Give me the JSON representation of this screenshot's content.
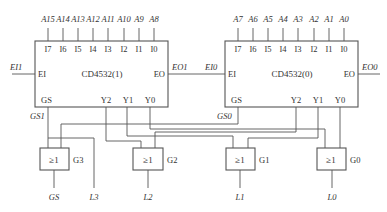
{
  "chips": [
    {
      "name": "CD4532(1)",
      "inputs_top": [
        "I7",
        "I6",
        "I5",
        "I4",
        "I3",
        "I2",
        "I1",
        "I0"
      ],
      "address_labels": [
        "A15",
        "A14",
        "A13",
        "A12",
        "A11",
        "A10",
        "A9",
        "A8"
      ],
      "ei_pin": "EI",
      "eo_pin": "EO",
      "gs_pin": "GS",
      "outputs_bottom": [
        "Y2",
        "Y1",
        "Y0"
      ],
      "ei_net": "EI1",
      "eo_net": "EO1",
      "gs_net": "GS1"
    },
    {
      "name": "CD4532(0)",
      "inputs_top": [
        "I7",
        "I6",
        "I5",
        "I4",
        "I3",
        "I2",
        "I1",
        "I0"
      ],
      "address_labels": [
        "A7",
        "A6",
        "A5",
        "A4",
        "A3",
        "A2",
        "A1",
        "A0"
      ],
      "ei_pin": "EI",
      "eo_pin": "EO",
      "gs_pin": "GS",
      "outputs_bottom": [
        "Y2",
        "Y1",
        "Y0"
      ],
      "ei_net": "EI0",
      "eo_net": "EO0",
      "gs_net": "GS0"
    }
  ],
  "gates": [
    {
      "symbol": "≥1",
      "label": "G3",
      "output": "GS"
    },
    {
      "symbol": "≥1",
      "label": "G2",
      "output": "L2"
    },
    {
      "symbol": "≥1",
      "label": "G1",
      "output": "L1"
    },
    {
      "symbol": "≥1",
      "label": "G0",
      "output": "L0"
    }
  ],
  "extra_output": "L3"
}
